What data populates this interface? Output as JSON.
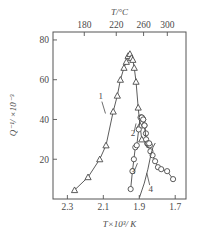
{
  "figure": {
    "caption_present": false,
    "background_color": "#ffffff",
    "ink_color": "#4a4a4a"
  },
  "chart_data": {
    "type": "line",
    "title": "",
    "subtitle": "",
    "xlabel": "T×10³/ K",
    "ylabel": "Q⁻¹/ ×10⁻³",
    "top_axis_label": "T/°C",
    "xlim": [
      2.38,
      1.64
    ],
    "ylim": [
      0,
      84
    ],
    "x_inverted": true,
    "grid": false,
    "legend_position": "inline-curve-labels",
    "xticks": [
      2.3,
      2.1,
      1.9,
      1.7
    ],
    "xtick_labels": [
      "2.3",
      "2.1",
      "1.9",
      "1.7"
    ],
    "yticks": [
      20,
      40,
      60,
      80
    ],
    "ytick_labels": [
      "20",
      "40",
      "60",
      "80"
    ],
    "top_xticks_celsius": [
      180,
      220,
      260,
      300
    ],
    "top_xtick_labels": [
      "180",
      "220",
      "260",
      "300"
    ],
    "top_xticks_position_1000overT": [
      2.206,
      2.028,
      1.876,
      1.744
    ],
    "series": [
      {
        "name": "1",
        "marker": "triangle-up",
        "label_x": 2.115,
        "label_y": 52,
        "points": [
          {
            "x": 2.26,
            "y": 4.5
          },
          {
            "x": 2.185,
            "y": 11
          },
          {
            "x": 2.12,
            "y": 20
          },
          {
            "x": 2.085,
            "y": 27
          },
          {
            "x": 2.045,
            "y": 44
          },
          {
            "x": 2.022,
            "y": 52
          },
          {
            "x": 2.005,
            "y": 60
          },
          {
            "x": 1.985,
            "y": 66
          },
          {
            "x": 1.972,
            "y": 69
          },
          {
            "x": 1.962,
            "y": 72
          },
          {
            "x": 1.952,
            "y": 73
          },
          {
            "x": 1.944,
            "y": 71
          },
          {
            "x": 1.936,
            "y": 70
          },
          {
            "x": 1.928,
            "y": 66
          },
          {
            "x": 1.918,
            "y": 59
          },
          {
            "x": 1.906,
            "y": 46
          },
          {
            "x": 1.896,
            "y": 37
          },
          {
            "x": 1.886,
            "y": 30
          }
        ]
      },
      {
        "name": "2",
        "marker": "circle",
        "label_x": 1.935,
        "label_y": 33,
        "points": [
          {
            "x": 1.948,
            "y": 5
          },
          {
            "x": 1.938,
            "y": 14
          },
          {
            "x": 1.93,
            "y": 20
          },
          {
            "x": 1.922,
            "y": 26
          },
          {
            "x": 1.914,
            "y": 27
          },
          {
            "x": 1.903,
            "y": 35
          },
          {
            "x": 1.893,
            "y": 41
          },
          {
            "x": 1.886,
            "y": 41
          },
          {
            "x": 1.878,
            "y": 40
          },
          {
            "x": 1.871,
            "y": 37
          },
          {
            "x": 1.863,
            "y": 33
          },
          {
            "x": 1.856,
            "y": 28
          },
          {
            "x": 1.848,
            "y": 27
          },
          {
            "x": 1.841,
            "y": 27
          },
          {
            "x": 1.838,
            "y": 24
          },
          {
            "x": 1.826,
            "y": 22
          },
          {
            "x": 1.812,
            "y": 19
          },
          {
            "x": 1.796,
            "y": 16
          },
          {
            "x": 1.778,
            "y": 15
          },
          {
            "x": 1.745,
            "y": 14
          },
          {
            "x": 1.712,
            "y": 10
          }
        ]
      },
      {
        "name": "3",
        "marker": "circle",
        "label_x": 1.935,
        "label_y": 14,
        "points": [
          {
            "x": 1.886,
            "y": 41
          },
          {
            "x": 1.878,
            "y": 40
          },
          {
            "x": 1.871,
            "y": 37
          },
          {
            "x": 1.862,
            "y": 30
          },
          {
            "x": 1.852,
            "y": 28
          },
          {
            "x": 1.845,
            "y": 28
          }
        ]
      },
      {
        "name": "4",
        "marker": "none",
        "label_x": 1.836,
        "label_y": 5,
        "points": [
          {
            "x": 1.898,
            "y": 1
          },
          {
            "x": 1.872,
            "y": 8
          },
          {
            "x": 1.852,
            "y": 15
          },
          {
            "x": 1.836,
            "y": 22
          },
          {
            "x": 1.824,
            "y": 26
          },
          {
            "x": 1.812,
            "y": 28
          }
        ]
      }
    ],
    "curve_label_leaders": [
      {
        "name": "1",
        "from_x": 2.108,
        "from_y": 49,
        "to_x": 2.088,
        "to_y": 43
      },
      {
        "name": "2",
        "from_x": 1.928,
        "from_y": 34,
        "to_x": 1.918,
        "to_y": 38
      },
      {
        "name": "3",
        "from_x": 1.928,
        "from_y": 14,
        "to_x": 1.91,
        "to_y": 18
      },
      {
        "name": "4",
        "from_x": 1.842,
        "from_y": 7,
        "to_x": 1.858,
        "to_y": 13
      }
    ]
  }
}
